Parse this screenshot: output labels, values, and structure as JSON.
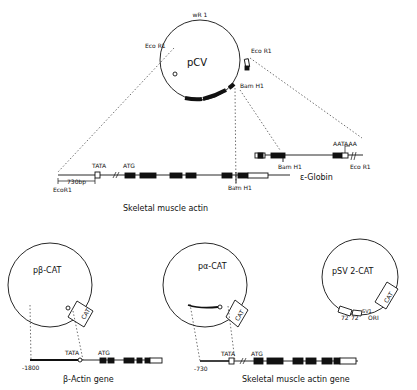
{
  "top_plasmid": {
    "name": "pCV",
    "origin_label": "wR 1",
    "eco_left": "Eco R1",
    "eco_right": "Eco R1",
    "bam": "Bam H1"
  },
  "skeletal_map": {
    "tata": "TATA",
    "atg": "ATG",
    "distance": "730bp",
    "eco": "EcoR1",
    "bam": "Bam H1",
    "caption": "Skeletal muscle actin"
  },
  "globin_map": {
    "aataaa": "AATAAA",
    "bam": "Bam H1",
    "eco": "Eco R1",
    "caption": "ε-Globin"
  },
  "beta_cat": {
    "name": "pβ-CAT",
    "cat": "CAT",
    "tata": "TATA",
    "atg": "ATG",
    "position": "-1800",
    "caption": "β-Actin gene"
  },
  "alpha_cat": {
    "name": "pα-CAT",
    "cat": "CAT",
    "tata": "TATA",
    "atg": "ATG",
    "position": "-730",
    "caption": "Skeletal muscle actin gene"
  },
  "sv2_cat": {
    "name": "pSV 2-CAT",
    "cat": "CAT",
    "t72a": "72",
    "t72b": "72",
    "sv": "SV1",
    "ori": "ORI"
  }
}
